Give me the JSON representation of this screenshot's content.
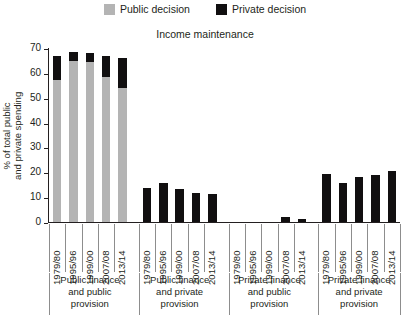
{
  "legend": {
    "items": [
      {
        "label": "Public decision",
        "color": "#b4b4b4",
        "icon": "legend-swatch-public"
      },
      {
        "label": "Private decision",
        "color": "#110f10",
        "icon": "legend-swatch-private"
      }
    ]
  },
  "title": "Income maintenance",
  "axes": {
    "ylabel_line1": "% of total public",
    "ylabel_line2": "and private spending",
    "yticks": [
      0,
      10,
      20,
      30,
      40,
      50,
      60,
      70
    ]
  },
  "groups": [
    {
      "label_line1": "Public finance",
      "label_line2": "and public",
      "label_line3": "provision"
    },
    {
      "label_line1": "Public finance",
      "label_line2": "and private",
      "label_line3": "provision"
    },
    {
      "label_line1": "Private finance",
      "label_line2": "and public",
      "label_line3": "provision"
    },
    {
      "label_line1": "Private finance",
      "label_line2": "and private",
      "label_line3": "provision"
    }
  ],
  "years": [
    "1979/80",
    "1995/96",
    "1999/00",
    "2007/08",
    "2013/14"
  ],
  "chart_data": {
    "type": "bar",
    "title": "Income maintenance",
    "xlabel": "",
    "ylabel": "% of total public and private spending",
    "ylim": [
      0,
      70
    ],
    "ytick_step": 10,
    "grid": false,
    "legend_position": "top-center",
    "stacked": true,
    "categories": [
      "Public finance and public provision 1979/80",
      "Public finance and public provision 1995/96",
      "Public finance and public provision 1999/00",
      "Public finance and public provision 2007/08",
      "Public finance and public provision 2013/14",
      "Public finance and private provision 1979/80",
      "Public finance and private provision 1995/96",
      "Public finance and private provision 1999/00",
      "Public finance and private provision 2007/08",
      "Public finance and private provision 2013/14",
      "Private finance and public provision 1979/80",
      "Private finance and public provision 1995/96",
      "Private finance and public provision 1999/00",
      "Private finance and public provision 2007/08",
      "Private finance and public provision 2013/14",
      "Private finance and private provision 1979/80",
      "Private finance and private provision 1995/96",
      "Private finance and private provision 1999/00",
      "Private finance and private provision 2007/08",
      "Private finance and private provision 2013/14"
    ],
    "series": [
      {
        "name": "Public decision",
        "color": "#b4b4b4",
        "values": [
          57.0,
          64.8,
          64.5,
          58.3,
          54.0,
          0,
          0,
          0,
          0,
          0,
          0,
          0,
          0,
          0,
          0,
          0,
          0,
          0,
          0,
          0
        ]
      },
      {
        "name": "Private decision",
        "color": "#110f10",
        "values": [
          9.6,
          3.5,
          3.4,
          8.5,
          12.0,
          13.6,
          15.8,
          13.4,
          11.7,
          11.2,
          0,
          0,
          0,
          2.0,
          1.2,
          19.5,
          15.7,
          18.0,
          18.8,
          20.7
        ]
      }
    ],
    "totals": [
      66.6,
      68.3,
      67.9,
      66.8,
      66.0,
      13.6,
      15.8,
      13.4,
      11.7,
      11.2,
      0,
      0,
      0,
      2.0,
      1.2,
      19.5,
      15.7,
      18.0,
      18.8,
      20.7
    ]
  }
}
